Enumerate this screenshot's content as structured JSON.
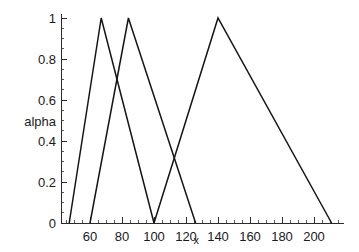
{
  "chart_data": {
    "type": "line",
    "title": "",
    "subtitle": "",
    "xlabel": "x",
    "ylabel": "alpha",
    "xlim": [
      45,
      215
    ],
    "ylim": [
      0,
      1
    ],
    "grid": false,
    "legend": "none",
    "x_ticks": [
      60,
      80,
      100,
      120,
      140,
      160,
      180,
      200
    ],
    "x_tick_labels": [
      "60",
      "80",
      "100",
      "120",
      "140",
      "160",
      "180",
      "200"
    ],
    "x_minor_tick_step": 5,
    "y_ticks": [
      0,
      0.2,
      0.4,
      0.6,
      0.8,
      1
    ],
    "y_tick_labels": [
      "0",
      "0.2",
      "0.4",
      "0.6",
      "0.8",
      "1"
    ],
    "y_minor_tick_step": 0.05,
    "line_color": "#151515",
    "axis_color": "#2b2b2b",
    "background": "#ffffff",
    "series": [
      {
        "name": "membership-1",
        "shape": "triangular",
        "points": [
          {
            "x": 47,
            "y": 0
          },
          {
            "x": 67,
            "y": 1
          },
          {
            "x": 100,
            "y": 0
          }
        ]
      },
      {
        "name": "membership-2",
        "shape": "triangular",
        "points": [
          {
            "x": 60,
            "y": 0
          },
          {
            "x": 84,
            "y": 1
          },
          {
            "x": 126,
            "y": 0
          }
        ]
      },
      {
        "name": "membership-3",
        "shape": "triangular",
        "points": [
          {
            "x": 100,
            "y": 0
          },
          {
            "x": 140,
            "y": 1
          },
          {
            "x": 211,
            "y": 0
          }
        ]
      }
    ]
  }
}
